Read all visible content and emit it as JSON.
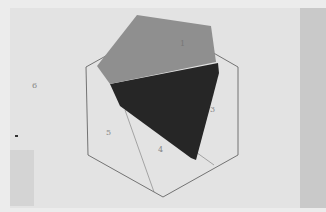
{
  "scene": {
    "description": "Fabric pieces placed on a paper template with a hexagon drawn and pieces numbered",
    "labels": [
      {
        "text": "6",
        "x": 32,
        "y": 88
      },
      {
        "text": "5",
        "x": 106,
        "y": 135
      },
      {
        "text": "4",
        "x": 158,
        "y": 152
      },
      {
        "text": "3",
        "x": 210,
        "y": 112
      },
      {
        "text": "1",
        "x": 180,
        "y": 46
      }
    ],
    "colors": {
      "paper": "#e6e6e6",
      "right_strip": "#c9c9c9",
      "gray_fabric": "#8f8f8f",
      "dark_fabric": "#262626",
      "lines": "#555555"
    }
  }
}
